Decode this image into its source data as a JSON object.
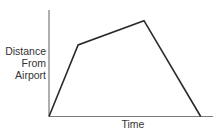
{
  "chart_data": {
    "type": "line",
    "title": "",
    "xlabel": "Time",
    "ylabel": "Distance From Airport",
    "ylabel_lines": [
      "Distance",
      "From",
      "Airport"
    ],
    "grid": false,
    "legend": null,
    "ticks": false,
    "axis_color": "#7a7a7a",
    "line_color": "#2a2a2a",
    "x": [
      0,
      0.19,
      0.62,
      0.99
    ],
    "y": [
      0,
      0.74,
      0.99,
      0
    ],
    "xlim": [
      0,
      1.07
    ],
    "ylim": [
      0,
      1.1
    ],
    "segments": [
      {
        "description": "steep increase",
        "from": [
          0,
          0
        ],
        "to": [
          0.19,
          0.74
        ]
      },
      {
        "description": "gradual increase",
        "from": [
          0.19,
          0.74
        ],
        "to": [
          0.62,
          0.99
        ]
      },
      {
        "description": "decrease back to zero",
        "from": [
          0.62,
          0.99
        ],
        "to": [
          0.99,
          0
        ]
      }
    ]
  }
}
